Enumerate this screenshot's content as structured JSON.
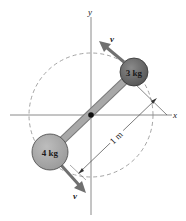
{
  "diagram": {
    "type": "rotating-dumbbell",
    "axes": {
      "x_label": "x",
      "y_label": "y"
    },
    "masses": [
      {
        "label": "3 kg",
        "color": "#6e6e6e"
      },
      {
        "label": "4 kg",
        "color": "#a6a6a6"
      }
    ],
    "velocity_labels": {
      "top": "v",
      "bottom": "v"
    },
    "dimension": {
      "label": "1 m"
    },
    "colors": {
      "rod": "#a8a8a8",
      "arrow": "#707070",
      "axis": "#8a8a8a",
      "dashed_circle": "#9a9a9a",
      "pivot": "#111111"
    }
  }
}
